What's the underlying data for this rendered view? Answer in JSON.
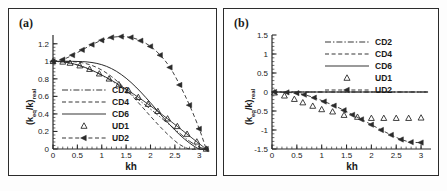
{
  "figure": {
    "panels": [
      {
        "id": "a",
        "label": "(a)"
      },
      {
        "id": "b",
        "label": "(b)"
      }
    ]
  },
  "chart_data": [
    {
      "type": "line",
      "panel_label": "(a)",
      "title": "",
      "xlabel": "kh",
      "ylabel": "(k_eq/k)_real",
      "ylabel_main": "(k",
      "ylabel_sub1": "eq",
      "ylabel_mid": "/k)",
      "ylabel_sub2": "real",
      "xlim": [
        0,
        3.2
      ],
      "ylim": [
        0,
        1.3
      ],
      "xticks": [
        0,
        0.5,
        1,
        1.5,
        2,
        2.5,
        3
      ],
      "xticklabels": [
        "0",
        "0.5",
        "1",
        "1.5",
        "2",
        "2.5",
        "3"
      ],
      "yticks": [
        0,
        0.2,
        0.4,
        0.6,
        0.8,
        1.0,
        1.2
      ],
      "yticklabels": [
        "0",
        "0.2",
        "0.4",
        "0.6",
        "0.8",
        "1",
        "1.2"
      ],
      "grid": false,
      "legend_position": "center-left",
      "series": [
        {
          "name": "CD2",
          "style": "dashdot",
          "marker": "none",
          "x": [
            0,
            0.2,
            0.4,
            0.6,
            0.8,
            1.0,
            1.2,
            1.4,
            1.6,
            1.8,
            2.0,
            2.2,
            2.4,
            2.6,
            2.8,
            3.0,
            3.1416
          ],
          "values": [
            1.0,
            0.993,
            0.974,
            0.941,
            0.896,
            0.841,
            0.777,
            0.705,
            0.626,
            0.542,
            0.455,
            0.364,
            0.272,
            0.18,
            0.089,
            0.0235,
            0.0
          ]
        },
        {
          "name": "CD4",
          "style": "dashed",
          "marker": "none",
          "x": [
            0,
            0.2,
            0.4,
            0.6,
            0.8,
            1.0,
            1.2,
            1.4,
            1.6,
            1.8,
            2.0,
            2.2,
            2.4,
            2.6,
            2.8,
            3.0,
            3.1416
          ],
          "values": [
            1.0,
            0.9998,
            0.9966,
            0.9832,
            0.9525,
            0.9005,
            0.8262,
            0.7313,
            0.62,
            0.4984,
            0.3734,
            0.2525,
            0.1428,
            0.0503,
            -0.0,
            0.0,
            0.0
          ]
        },
        {
          "name": "CD6",
          "style": "solid",
          "marker": "none",
          "x": [
            0,
            0.2,
            0.4,
            0.6,
            0.8,
            1.0,
            1.2,
            1.4,
            1.6,
            1.8,
            2.0,
            2.2,
            2.4,
            2.6,
            2.8,
            3.0,
            3.1416
          ],
          "values": [
            1.0,
            1.0,
            0.9996,
            0.9967,
            0.9862,
            0.9615,
            0.917,
            0.8496,
            0.7594,
            0.6498,
            0.5268,
            0.3986,
            0.2739,
            0.1612,
            0.0683,
            0.0,
            0.0
          ]
        },
        {
          "name": "UD1",
          "style": "solid",
          "marker": "triangle-up-open",
          "x": [
            0,
            0.2,
            0.35,
            0.55,
            0.75,
            0.95,
            1.15,
            1.35,
            1.55,
            1.75,
            1.95,
            2.15,
            2.35,
            2.55,
            2.75,
            2.95,
            3.1416
          ],
          "values": [
            1.0,
            0.993,
            0.98,
            0.95,
            0.91,
            0.858,
            0.8,
            0.735,
            0.665,
            0.59,
            0.512,
            0.43,
            0.345,
            0.258,
            0.17,
            0.082,
            0.0
          ]
        },
        {
          "name": "UD2",
          "style": "dashed",
          "marker": "triangle-left-filled",
          "x": [
            0,
            0.2,
            0.4,
            0.6,
            0.8,
            1.0,
            1.2,
            1.4,
            1.6,
            1.8,
            2.0,
            2.2,
            2.4,
            2.6,
            2.8,
            3.0,
            3.1416
          ],
          "values": [
            1.0,
            1.02,
            1.07,
            1.13,
            1.19,
            1.24,
            1.272,
            1.282,
            1.272,
            1.235,
            1.17,
            1.07,
            0.93,
            0.73,
            0.5,
            0.23,
            0.0
          ]
        }
      ]
    },
    {
      "type": "line",
      "panel_label": "(b)",
      "title": "",
      "xlabel": "kh",
      "ylabel": "(k_eq/k)_real",
      "ylabel_main": "(k",
      "ylabel_sub1": "eq",
      "ylabel_mid": "/k)",
      "ylabel_sub2": "real",
      "xlim": [
        0,
        3.2
      ],
      "ylim": [
        -1.5,
        1.5
      ],
      "xticks": [
        0,
        0.5,
        1,
        1.5,
        2,
        2.5,
        3
      ],
      "xticklabels": [
        "0",
        "0.5",
        "1",
        "1.5",
        "2",
        "2.5",
        "3"
      ],
      "yticks": [
        -1.5,
        -1,
        -0.5,
        0,
        0.5,
        1,
        1.5
      ],
      "yticklabels": [
        "-1.5",
        "-1",
        "-0.5",
        "0",
        "0.5",
        "1",
        "1.5"
      ],
      "grid": false,
      "legend_position": "top-center",
      "series": [
        {
          "name": "CD2",
          "style": "dashdot",
          "marker": "none",
          "x": [
            0,
            3.1416
          ],
          "values": [
            0,
            0
          ]
        },
        {
          "name": "CD4",
          "style": "dashed",
          "marker": "none",
          "x": [
            0,
            3.1416
          ],
          "values": [
            0,
            0
          ]
        },
        {
          "name": "CD6",
          "style": "solid",
          "marker": "none",
          "x": [
            0,
            3.1416
          ],
          "values": [
            0,
            0
          ]
        },
        {
          "name": "UD1",
          "style": "none",
          "marker": "triangle-up-open",
          "x": [
            0.05,
            0.25,
            0.45,
            0.62,
            0.82,
            1.0,
            1.22,
            1.45,
            1.72,
            2.0,
            2.25,
            2.5,
            2.75,
            3.0
          ],
          "values": [
            -0.02,
            -0.1,
            -0.19,
            -0.28,
            -0.37,
            -0.46,
            -0.52,
            -0.61,
            -0.66,
            -0.69,
            -0.69,
            -0.69,
            -0.69,
            -0.68
          ]
        },
        {
          "name": "UD2",
          "style": "dashed",
          "marker": "triangle-left-filled",
          "x": [
            0.05,
            0.3,
            0.5,
            0.65,
            0.85,
            1.05,
            1.25,
            1.45,
            1.62,
            1.8,
            2.0,
            2.2,
            2.4,
            2.6,
            2.8,
            3.0
          ],
          "values": [
            0.0,
            -0.01,
            -0.03,
            -0.07,
            -0.15,
            -0.25,
            -0.36,
            -0.48,
            -0.6,
            -0.72,
            -0.86,
            -1.0,
            -1.13,
            -1.25,
            -1.32,
            -1.33
          ]
        }
      ]
    }
  ],
  "legend": {
    "entries": [
      {
        "label": "CD2",
        "style": "dashdot",
        "marker": "none"
      },
      {
        "label": "CD4",
        "style": "dashed",
        "marker": "none"
      },
      {
        "label": "CD6",
        "style": "solid",
        "marker": "none"
      },
      {
        "label": "UD1",
        "style": "none",
        "marker": "triangle-up-open"
      },
      {
        "label": "UD2",
        "style": "dashed",
        "marker": "triangle-left-filled"
      }
    ]
  },
  "colors": {
    "line": "#2b2b2b",
    "frame": "#2b2b2b",
    "background": "#ffffff",
    "text": "#1a1a1a"
  }
}
